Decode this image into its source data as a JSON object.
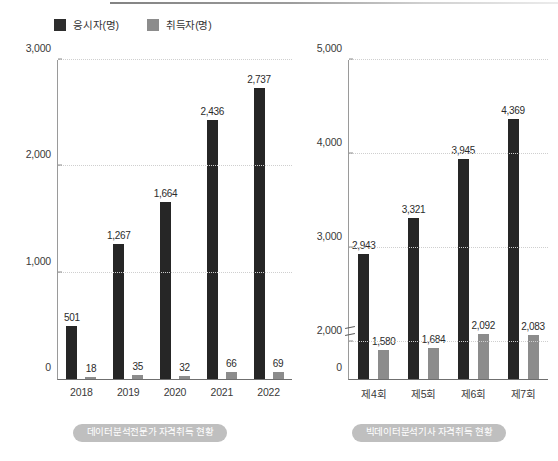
{
  "legend": {
    "items": [
      {
        "label": "응시자(명)",
        "icon": "square-swatch-dark",
        "color": "#2e2e2e"
      },
      {
        "label": "취득자(명)",
        "icon": "square-swatch-gray",
        "color": "#8c8c8c"
      }
    ]
  },
  "captions": {
    "left": "데이터분석전문가 자격취득 현황",
    "right": "빅데이터분석기사 자격취득 현황"
  },
  "chart_data": [
    {
      "type": "bar",
      "title": "데이터분석전문가 자격취득 현황",
      "xlabel": "",
      "ylabel": "",
      "categories": [
        "2018",
        "2019",
        "2020",
        "2021",
        "2022"
      ],
      "series": [
        {
          "name": "응시자(명)",
          "color": "#262626",
          "values": [
            501,
            1267,
            1664,
            2436,
            2737
          ],
          "labels": [
            "501",
            "1,267",
            "1,664",
            "2,436",
            "2,737"
          ]
        },
        {
          "name": "취득자(명)",
          "color": "#8c8c8c",
          "values": [
            18,
            35,
            32,
            66,
            69
          ],
          "labels": [
            "18",
            "35",
            "32",
            "66",
            "69"
          ]
        }
      ],
      "ylim": [
        0,
        3000
      ],
      "yticks": [
        0,
        1000,
        2000,
        3000
      ],
      "ytick_labels": [
        "0",
        "1,000",
        "2,000",
        "3,000"
      ],
      "grid": true,
      "axis_break": false,
      "legend_position": "top-left"
    },
    {
      "type": "bar",
      "title": "빅데이터분석기사 자격취득 현황",
      "xlabel": "",
      "ylabel": "",
      "categories": [
        "제4회",
        "제5회",
        "제6회",
        "제7회"
      ],
      "series": [
        {
          "name": "응시자(명)",
          "color": "#262626",
          "values": [
            2943,
            3321,
            3945,
            4369
          ],
          "labels": [
            "2,943",
            "3,321",
            "3,945",
            "4,369"
          ]
        },
        {
          "name": "취득자(명)",
          "color": "#8c8c8c",
          "values": [
            1580,
            1684,
            2092,
            2083
          ],
          "labels": [
            "1,580",
            "1,684",
            "2,092",
            "2,083"
          ]
        }
      ],
      "ylim": [
        0,
        5000
      ],
      "yticks": [
        0,
        2000,
        3000,
        4000,
        5000
      ],
      "ytick_labels": [
        "0",
        "2,000",
        "3,000",
        "4,000",
        "5,000"
      ],
      "grid": true,
      "axis_break": true,
      "axis_break_note": "y-axis break between 0 and 2,000",
      "legend_position": "top-left"
    }
  ]
}
